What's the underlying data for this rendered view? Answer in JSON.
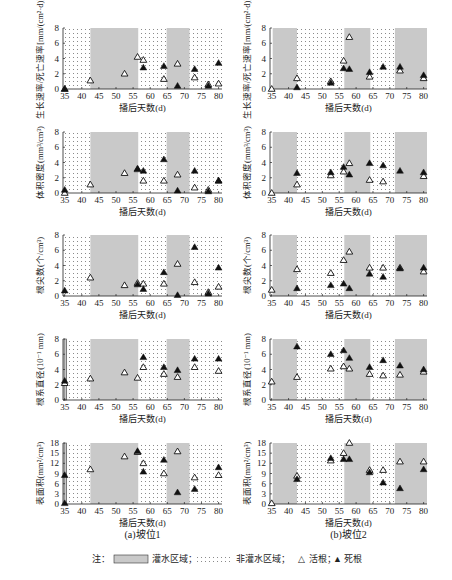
{
  "figure": {
    "xlabel": "播后天数(d)",
    "xticks": [
      35,
      40,
      45,
      50,
      55,
      60,
      65,
      70,
      75,
      80
    ],
    "xlim": [
      34.5,
      81
    ],
    "columns": [
      {
        "caption": "(a)坡位1"
      },
      {
        "caption": "(b)坡位2"
      }
    ],
    "legend": {
      "prefix": "注：",
      "irrigated": "灌水区域；",
      "non_irrigated": "非灌水区域；",
      "live": "活根；",
      "dead": "死根",
      "live_symbol": "△",
      "dead_symbol": "▲"
    },
    "colors": {
      "irrigated": "#c9c9c9",
      "non_irrigated_dots": "#8a8a8a",
      "marker": "#111111"
    }
  },
  "chart_data": [
    {
      "type": "scatter",
      "panel": "a1",
      "column": "坡位1",
      "ylabel": "生长速率/死亡速率[mm/(cm²·d)]",
      "xlabel": "播后天数(d)",
      "yticks": [
        0,
        2,
        4,
        6,
        8
      ],
      "ylim": [
        0,
        8
      ],
      "irrigated_ranges": [
        [
          42.5,
          56.5
        ],
        [
          64.8,
          71.5
        ]
      ],
      "series": [
        {
          "name": "活根",
          "x": [
            35,
            42.5,
            52.5,
            56.3,
            58,
            64,
            68,
            73,
            77,
            80
          ],
          "y": [
            0,
            1.1,
            2.0,
            4.2,
            3.8,
            1.3,
            3.3,
            1.5,
            0.6,
            0.7
          ]
        },
        {
          "name": "死根",
          "x": [
            35,
            58,
            64,
            68,
            73,
            77,
            80
          ],
          "y": [
            0,
            2.8,
            3.0,
            0.4,
            2.6,
            0.4,
            3.4
          ]
        }
      ]
    },
    {
      "type": "scatter",
      "panel": "b1",
      "column": "坡位2",
      "ylabel": "生长速率/死亡速率[mm/(cm²·d)]",
      "xlabel": "播后天数(d)",
      "yticks": [
        0,
        2,
        4,
        6,
        8
      ],
      "ylim": [
        0,
        8
      ],
      "irrigated_ranges": [
        [
          35.3,
          42.5
        ],
        [
          56.5,
          64.2
        ],
        [
          71.5,
          81
        ]
      ],
      "series": [
        {
          "name": "活根",
          "x": [
            35,
            42.5,
            52.5,
            56.3,
            58,
            64,
            73,
            80
          ],
          "y": [
            0,
            1.4,
            1.0,
            3.7,
            6.8,
            1.6,
            2.4,
            1.4
          ]
        },
        {
          "name": "死根",
          "x": [
            42.5,
            52.5,
            56.3,
            58,
            64,
            68,
            73,
            80
          ],
          "y": [
            0.2,
            0.8,
            2.7,
            2.6,
            2.2,
            2.9,
            2.9,
            1.8
          ]
        }
      ]
    },
    {
      "type": "scatter",
      "panel": "a2",
      "column": "坡位1",
      "ylabel": "体积密度(mm³/cm³)",
      "xlabel": "播后天数(d)",
      "yticks": [
        0,
        2,
        4,
        6,
        8
      ],
      "ylim": [
        0,
        8
      ],
      "irrigated_ranges": [
        [
          42.5,
          56.5
        ],
        [
          64.8,
          71.5
        ]
      ],
      "series": [
        {
          "name": "活根",
          "x": [
            35,
            42.5,
            52.5,
            56.3,
            58,
            64,
            68,
            73,
            77,
            80
          ],
          "y": [
            0,
            1.1,
            2.6,
            3.1,
            1.6,
            1.6,
            2.4,
            0.7,
            0.4,
            1.6
          ]
        },
        {
          "name": "死根",
          "x": [
            35,
            56.3,
            58,
            64,
            68,
            73,
            77,
            80
          ],
          "y": [
            0.4,
            3.2,
            2.9,
            4.4,
            0.3,
            2.9,
            0.2,
            1.6
          ]
        }
      ]
    },
    {
      "type": "scatter",
      "panel": "b2",
      "column": "坡位2",
      "ylabel": "体积密度(mm³/cm³)",
      "xlabel": "播后天数(d)",
      "yticks": [
        0,
        2,
        4,
        6,
        8
      ],
      "ylim": [
        0,
        8
      ],
      "irrigated_ranges": [
        [
          35.3,
          42.5
        ],
        [
          56.5,
          64.2
        ],
        [
          71.5,
          81
        ]
      ],
      "series": [
        {
          "name": "活根",
          "x": [
            35,
            42.5,
            52.5,
            56.3,
            58,
            64,
            68,
            80
          ],
          "y": [
            0,
            1.1,
            2.3,
            2.8,
            3.9,
            1.7,
            1.5,
            2.2
          ]
        },
        {
          "name": "死根",
          "x": [
            42.5,
            52.5,
            56.3,
            58,
            64,
            68,
            73,
            80
          ],
          "y": [
            2.6,
            2.7,
            3.4,
            2.4,
            3.9,
            3.6,
            2.9,
            2.7
          ]
        }
      ]
    },
    {
      "type": "scatter",
      "panel": "a3",
      "column": "坡位1",
      "ylabel": "根尖数(个/cm³)",
      "xlabel": "播后天数(d)",
      "yticks": [
        0,
        2,
        4,
        6,
        8
      ],
      "ylim": [
        0,
        8
      ],
      "irrigated_ranges": [
        [
          42.5,
          56.5
        ],
        [
          64.8,
          71.5
        ]
      ],
      "series": [
        {
          "name": "活根",
          "x": [
            42.5,
            52.5,
            56.3,
            58,
            64,
            68,
            73,
            77,
            80
          ],
          "y": [
            2.4,
            1.4,
            1.7,
            1.6,
            1.6,
            4.2,
            1.8,
            0.5,
            1.2
          ]
        },
        {
          "name": "死根",
          "x": [
            35,
            56.3,
            58,
            64,
            68,
            73,
            77,
            80
          ],
          "y": [
            0.7,
            1.5,
            0.9,
            3.1,
            0.1,
            6.4,
            0.3,
            3.7
          ]
        }
      ]
    },
    {
      "type": "scatter",
      "panel": "b3",
      "column": "坡位2",
      "ylabel": "根尖数(个/cm³)",
      "xlabel": "播后天数(d)",
      "yticks": [
        0,
        2,
        4,
        6,
        8
      ],
      "ylim": [
        0,
        8
      ],
      "irrigated_ranges": [
        [
          35.3,
          42.5
        ],
        [
          56.5,
          64.2
        ],
        [
          71.5,
          81
        ]
      ],
      "series": [
        {
          "name": "活根",
          "x": [
            35,
            42.5,
            52.5,
            56.3,
            58,
            64,
            68,
            73,
            80
          ],
          "y": [
            0.8,
            3.5,
            3.0,
            4.7,
            5.8,
            3.7,
            3.7,
            3.7,
            3.2
          ]
        },
        {
          "name": "死根",
          "x": [
            42.5,
            52.5,
            56.3,
            58,
            64,
            68,
            73,
            80
          ],
          "y": [
            1.0,
            1.4,
            1.6,
            1.0,
            2.9,
            2.5,
            3.6,
            3.7
          ]
        }
      ]
    },
    {
      "type": "scatter",
      "panel": "a4",
      "column": "坡位1",
      "ylabel": "根系直径(10⁻¹ mm)",
      "xlabel": "播后天数(d)",
      "yticks": [
        0,
        2,
        4,
        6,
        8
      ],
      "ylim": [
        0,
        8
      ],
      "irrigated_ranges": [
        [
          34.8,
          35.5
        ],
        [
          42.5,
          56.5
        ],
        [
          64.8,
          71.5
        ]
      ],
      "series": [
        {
          "name": "活根",
          "x": [
            35,
            42.5,
            52.5,
            56.3,
            58,
            64,
            68,
            73,
            80
          ],
          "y": [
            2.2,
            2.8,
            3.6,
            2.9,
            4.3,
            3.4,
            3.0,
            4.3,
            3.8
          ]
        },
        {
          "name": "死根",
          "x": [
            35,
            58,
            64,
            68,
            73,
            80
          ],
          "y": [
            2.5,
            5.6,
            4.3,
            3.9,
            5.4,
            5.4
          ]
        }
      ]
    },
    {
      "type": "scatter",
      "panel": "b4",
      "column": "坡位2",
      "ylabel": "根系直径(10⁻¹ mm)",
      "xlabel": "播后天数(d)",
      "yticks": [
        0,
        2,
        4,
        6,
        8
      ],
      "ylim": [
        0,
        8
      ],
      "irrigated_ranges": [
        [
          35.3,
          42.5
        ],
        [
          56.5,
          64.2
        ],
        [
          71.5,
          81
        ]
      ],
      "series": [
        {
          "name": "活根",
          "x": [
            35,
            42.5,
            52.5,
            56.3,
            58,
            64,
            68,
            73,
            80
          ],
          "y": [
            2.4,
            3.0,
            4.1,
            4.4,
            4.1,
            3.4,
            3.2,
            3.3,
            3.7
          ]
        },
        {
          "name": "死根",
          "x": [
            42.5,
            52.5,
            56.3,
            58,
            64,
            68,
            73,
            80
          ],
          "y": [
            7.0,
            6.0,
            6.5,
            5.5,
            4.3,
            5.2,
            4.5,
            4.0
          ]
        }
      ]
    },
    {
      "type": "scatter",
      "panel": "a5",
      "column": "坡位1",
      "ylabel": "表面积(mm²/cm³)",
      "xlabel": "播后天数(d)",
      "yticks": [
        0,
        3,
        6,
        9,
        12,
        15,
        18
      ],
      "ylim": [
        0,
        18
      ],
      "irrigated_ranges": [
        [
          34.8,
          35.5
        ],
        [
          42.5,
          56.5
        ],
        [
          64.8,
          71.5
        ]
      ],
      "series": [
        {
          "name": "活根",
          "x": [
            42.5,
            52.5,
            56.3,
            58,
            64,
            68,
            73,
            80
          ],
          "y": [
            10.2,
            14.0,
            15.3,
            12.0,
            9.0,
            15.5,
            7.8,
            8.5
          ]
        },
        {
          "name": "死根",
          "x": [
            35,
            35,
            56.3,
            58,
            64,
            68,
            73,
            80
          ],
          "y": [
            0.2,
            8.5,
            15.6,
            9.5,
            13.0,
            3.4,
            4.4,
            10.8
          ]
        }
      ]
    },
    {
      "type": "scatter",
      "panel": "b5",
      "column": "坡位2",
      "ylabel": "表面积(mm²/cm³)",
      "xlabel": "播后天数(d)",
      "yticks": [
        0,
        3,
        6,
        9,
        12,
        15,
        18
      ],
      "ylim": [
        0,
        18
      ],
      "irrigated_ranges": [
        [
          35.3,
          42.5
        ],
        [
          56.5,
          64.2
        ],
        [
          71.5,
          81
        ]
      ],
      "series": [
        {
          "name": "活根",
          "x": [
            35,
            42.5,
            52.5,
            56.3,
            58,
            64,
            68,
            73,
            80
          ],
          "y": [
            0.2,
            8.3,
            12.8,
            15.0,
            18.0,
            10.0,
            10.0,
            12.5,
            12.5
          ]
        },
        {
          "name": "死根",
          "x": [
            42.5,
            52.5,
            56.3,
            58,
            64,
            68,
            73,
            80
          ],
          "y": [
            7.3,
            13.5,
            13.2,
            13.2,
            9.3,
            6.3,
            4.6,
            10.2
          ]
        }
      ]
    }
  ]
}
